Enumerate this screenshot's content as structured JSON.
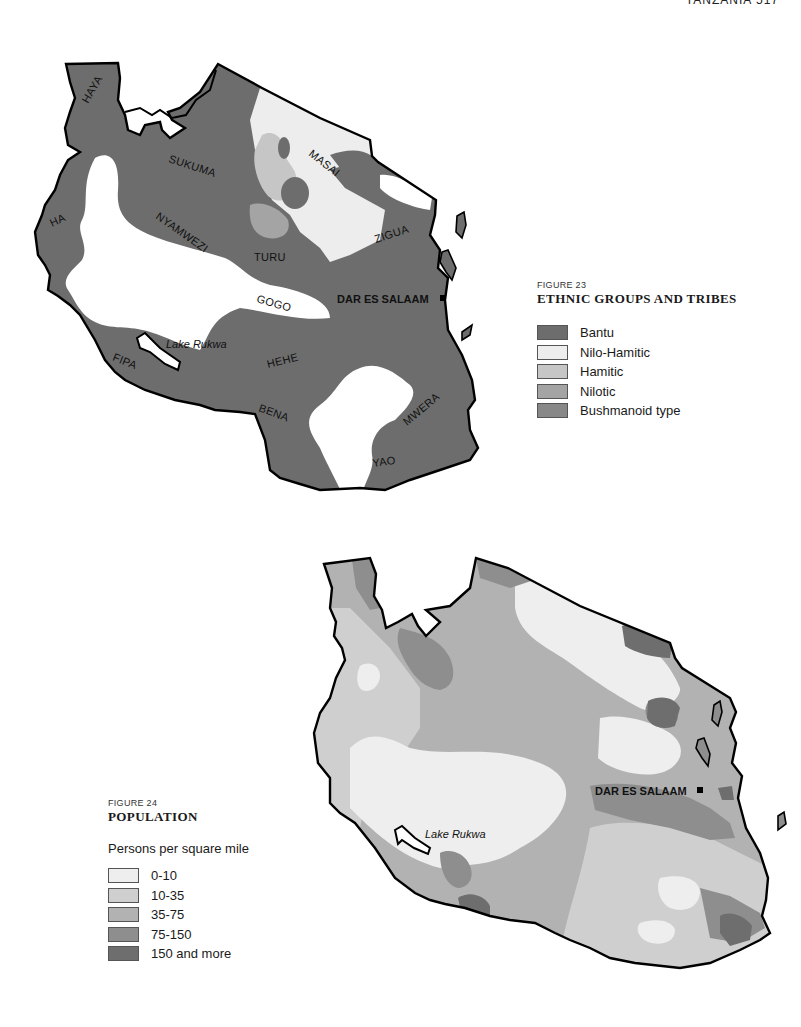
{
  "page": {
    "header": "TANZANIA  517"
  },
  "figure23": {
    "number": "FIGURE 23",
    "title": "ETHNIC GROUPS AND TRIBES",
    "legend": [
      {
        "label": "Bantu",
        "color": "#6d6d6d"
      },
      {
        "label": "Nilo-Hamitic",
        "color": "#ededed"
      },
      {
        "label": "Hamitic",
        "color": "#c6c6c6"
      },
      {
        "label": "Nilotic",
        "color": "#a4a4a4"
      },
      {
        "label": "Bushmanoid type",
        "color": "#888888"
      }
    ],
    "labels": {
      "haya": "HAYA",
      "sukuma": "SUKUMA",
      "masai": "MASAI",
      "ha": "HA",
      "nyamwezi": "NYAMWEZI",
      "turu": "TURU",
      "zigua": "ZIGUA",
      "gogo": "GOGO",
      "hehe": "HEHE",
      "fipa": "FIPA",
      "bena": "BENA",
      "mwera": "MWERA",
      "yao": "YAO",
      "lake": "Lake Rukwa",
      "city": "DAR ES SALAAM"
    }
  },
  "figure24": {
    "number": "FIGURE 24",
    "title": "POPULATION",
    "subtitle": "Persons per square mile",
    "legend": [
      {
        "label": "0-10",
        "color": "#eeeeee"
      },
      {
        "label": "10-35",
        "color": "#cfcfcf"
      },
      {
        "label": "35-75",
        "color": "#b2b2b2"
      },
      {
        "label": "75-150",
        "color": "#8e8e8e"
      },
      {
        "label": "150 and more",
        "color": "#6e6e6e"
      }
    ],
    "labels": {
      "lake": "Lake Rukwa",
      "city": "DAR ES SALAAM"
    }
  }
}
